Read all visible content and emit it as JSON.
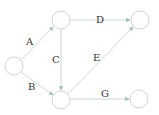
{
  "diagram": {
    "type": "directed-graph",
    "nodes": [
      {
        "id": "n1",
        "cx": 14,
        "cy": 66,
        "r": 9
      },
      {
        "id": "n2",
        "cx": 61,
        "cy": 20,
        "r": 9
      },
      {
        "id": "n3",
        "cx": 140,
        "cy": 20,
        "r": 9
      },
      {
        "id": "n4",
        "cx": 61,
        "cy": 100,
        "r": 9
      },
      {
        "id": "n5",
        "cx": 139,
        "cy": 99,
        "r": 9
      }
    ],
    "edges": [
      {
        "id": "A",
        "label": "A",
        "from": "n1",
        "to": "n2"
      },
      {
        "id": "B",
        "label": "B",
        "from": "n1",
        "to": "n4"
      },
      {
        "id": "C",
        "label": "C",
        "from": "n2",
        "to": "n4"
      },
      {
        "id": "D",
        "label": "D",
        "from": "n2",
        "to": "n3"
      },
      {
        "id": "E",
        "label": "E",
        "from": "n4",
        "to": "n3"
      },
      {
        "id": "G",
        "label": "G",
        "from": "n4",
        "to": "n5"
      }
    ],
    "colors": {
      "edge": "#b8ccc8",
      "node": "#c8c8c8",
      "label": "#333333"
    }
  }
}
